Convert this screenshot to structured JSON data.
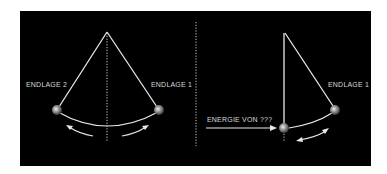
{
  "diagram": {
    "background": "#000000",
    "line_color": "#e0e0e0",
    "left_pendulum": {
      "label_left": "ENDLAGE 2",
      "label_right": "ENDLAGE 1"
    },
    "right_pendulum": {
      "label_endpoint": "ENDLAGE 1",
      "label_input": "ENERGIE VON ???"
    }
  }
}
